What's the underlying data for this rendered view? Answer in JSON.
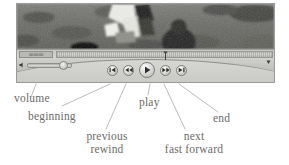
{
  "diagram": {
    "leader_color": "#9d9d99",
    "label_color": "#6b6b68"
  },
  "player": {
    "video": {
      "alt": "grayscale video still of a person's legs standing on grass"
    },
    "scrubber": {
      "timecode": "00:00:00",
      "playhead_label": "playhead-marker"
    },
    "volume": {
      "icon": "speaker-icon",
      "value_label": "volume-slider"
    },
    "buttons": [
      {
        "name": "beginning-button",
        "icon": "skip-to-start-icon"
      },
      {
        "name": "rewind-button",
        "icon": "rewind-icon"
      },
      {
        "name": "play-button",
        "icon": "play-icon"
      },
      {
        "name": "fast-forward-button",
        "icon": "fast-forward-icon"
      },
      {
        "name": "end-button",
        "icon": "skip-to-end-icon"
      }
    ]
  },
  "annotations": {
    "volume": "volume",
    "beginning": "beginning",
    "previous": "previous",
    "rewind": "rewind",
    "play": "play",
    "next": "next",
    "fast_forward": "fast forward",
    "end": "end"
  }
}
